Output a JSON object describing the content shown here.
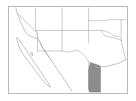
{
  "figure": {
    "kind": "locator-map",
    "alt_text": "Outline map showing U.S. states of California, Nevada, Utah, Arizona, Colorado, New Mexico, Oklahoma and Texas with northern Mexico below; one Gulf-coast Mexican state is shaded gray.",
    "width_px": "136",
    "height_px": "101"
  },
  "frame": {
    "border_color": "#b9b9b9",
    "background_color": "#ffffff",
    "left_px": "8",
    "top_px": "6",
    "width_px": "120",
    "height_px": "88"
  },
  "style": {
    "land_fill": "#ffffff",
    "boundary_stroke": "#b5b5b5",
    "coastline_stroke": "#a9a9a9",
    "highlight_fill": "#8d8d8d",
    "highlight_stroke": "#6f6f6f"
  },
  "regions": {
    "highlighted": [
      {
        "name": "Tamaulipas",
        "country": "Mexico",
        "fill": "#8d8d8d",
        "state": "selected"
      }
    ],
    "outlined": [
      {
        "name": "California",
        "country": "United States"
      },
      {
        "name": "Nevada",
        "country": "United States"
      },
      {
        "name": "Utah",
        "country": "United States"
      },
      {
        "name": "Arizona",
        "country": "United States"
      },
      {
        "name": "Colorado",
        "country": "United States"
      },
      {
        "name": "New Mexico",
        "country": "United States"
      },
      {
        "name": "Kansas",
        "country": "United States"
      },
      {
        "name": "Oklahoma",
        "country": "United States"
      },
      {
        "name": "Texas",
        "country": "United States"
      },
      {
        "name": "Baja California",
        "country": "Mexico"
      },
      {
        "name": "Baja California Sur",
        "country": "Mexico"
      },
      {
        "name": "Sonora",
        "country": "Mexico"
      },
      {
        "name": "Chihuahua",
        "country": "Mexico"
      },
      {
        "name": "Coahuila",
        "country": "Mexico"
      },
      {
        "name": "Nuevo Leon",
        "country": "Mexico"
      }
    ]
  },
  "water_features": [
    {
      "name": "Pacific Ocean"
    },
    {
      "name": "Gulf of California"
    },
    {
      "name": "Gulf of Mexico"
    }
  ],
  "labels": []
}
